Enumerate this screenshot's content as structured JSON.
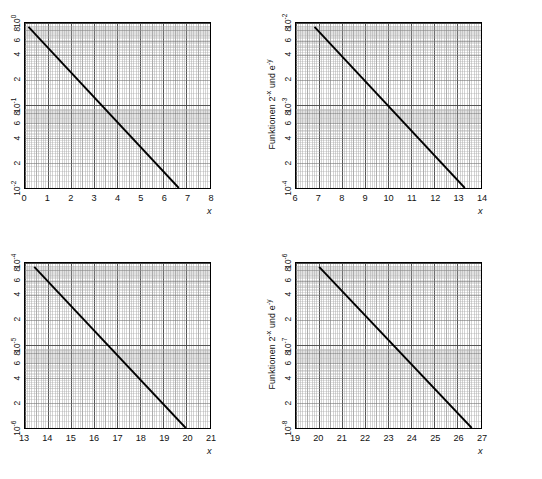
{
  "figure": {
    "kind": "semi-log-chart-grid",
    "background": "#ffffff",
    "line_color": "#000000",
    "grid_color": "#555555",
    "grid_minor_color": "#999999",
    "axis_title_y": "Funktionen 2",
    "axis_title_y_sup1": "-x",
    "axis_title_y_mid": " und e",
    "axis_title_y_sup2": "-y",
    "axis_title_x": "x"
  },
  "chart_data": [
    {
      "id": "panel-top-left",
      "type": "line",
      "title": "",
      "xlabel": "x",
      "ylabel": "Funktionen 2^-x und e^-y",
      "xlim": [
        0,
        8
      ],
      "ylim": [
        0.01,
        1
      ],
      "yscale": "log",
      "xscale": "linear",
      "grid": true,
      "legend": "none",
      "xticks": [
        "0",
        "1",
        "2",
        "3",
        "4",
        "5",
        "6",
        "7",
        "8"
      ],
      "xtick_values": [
        0,
        1,
        2,
        3,
        4,
        5,
        6,
        7,
        8
      ],
      "yticks": [
        "10",
        "8",
        "6",
        "4",
        "2",
        "10",
        "8",
        "6",
        "4",
        "2",
        "10"
      ],
      "ytick_exponents": [
        "0",
        "",
        "",
        "",
        "",
        "-1",
        "",
        "",
        "",
        "",
        "-2"
      ],
      "ytick_values": [
        1,
        0.8,
        0.6,
        0.4,
        0.2,
        0.1,
        0.08,
        0.06,
        0.04,
        0.02,
        0.01
      ],
      "series": [
        {
          "name": "2^-x",
          "x": [
            0.15,
            6.65
          ],
          "values": [
            0.9,
            0.01
          ]
        }
      ]
    },
    {
      "id": "panel-top-right",
      "type": "line",
      "title": "",
      "xlabel": "x",
      "ylabel": "Funktionen 2^-x und e^-y",
      "xlim": [
        6,
        14
      ],
      "ylim": [
        0.0001,
        0.01
      ],
      "yscale": "log",
      "xscale": "linear",
      "grid": true,
      "legend": "none",
      "xticks": [
        "6",
        "7",
        "8",
        "9",
        "10",
        "11",
        "12",
        "13",
        "14"
      ],
      "xtick_values": [
        6,
        7,
        8,
        9,
        10,
        11,
        12,
        13,
        14
      ],
      "yticks": [
        "10",
        "8",
        "6",
        "4",
        "2",
        "10",
        "8",
        "6",
        "4",
        "2",
        "10"
      ],
      "ytick_exponents": [
        "-2",
        "",
        "",
        "",
        "",
        "-3",
        "",
        "",
        "",
        "",
        "-4"
      ],
      "ytick_values": [
        0.01,
        0.008,
        0.006,
        0.004,
        0.002,
        0.001,
        0.0008,
        0.0006,
        0.0004,
        0.0002,
        0.0001
      ],
      "series": [
        {
          "name": "2^-x",
          "x": [
            6.8,
            13.3
          ],
          "values": [
            0.009,
            0.0001
          ]
        }
      ]
    },
    {
      "id": "panel-bottom-left",
      "type": "line",
      "title": "",
      "xlabel": "x",
      "ylabel": "Funktionen 2^-x und e^-y",
      "xlim": [
        13,
        21
      ],
      "ylim": [
        1e-06,
        0.0001
      ],
      "yscale": "log",
      "xscale": "linear",
      "grid": true,
      "legend": "none",
      "xticks": [
        "13",
        "14",
        "15",
        "16",
        "17",
        "18",
        "19",
        "20",
        "21"
      ],
      "xtick_values": [
        13,
        14,
        15,
        16,
        17,
        18,
        19,
        20,
        21
      ],
      "yticks": [
        "10",
        "8",
        "6",
        "4",
        "2",
        "10",
        "8",
        "6",
        "4",
        "2",
        "10"
      ],
      "ytick_exponents": [
        "-4",
        "",
        "",
        "",
        "",
        "-5",
        "",
        "",
        "",
        "",
        "-6"
      ],
      "ytick_values": [
        0.0001,
        8e-05,
        6e-05,
        4e-05,
        2e-05,
        1e-05,
        8e-06,
        6e-06,
        4e-06,
        2e-06,
        1e-06
      ],
      "series": [
        {
          "name": "2^-x",
          "x": [
            13.4,
            19.95
          ],
          "values": [
            9e-05,
            1e-06
          ]
        }
      ]
    },
    {
      "id": "panel-bottom-right",
      "type": "line",
      "title": "",
      "xlabel": "x",
      "ylabel": "Funktionen 2^-x und e^-y",
      "xlim": [
        19,
        27
      ],
      "ylim": [
        1e-08,
        1e-06
      ],
      "yscale": "log",
      "xscale": "linear",
      "grid": true,
      "legend": "none",
      "xticks": [
        "19",
        "20",
        "21",
        "22",
        "23",
        "24",
        "25",
        "26",
        "27"
      ],
      "xtick_values": [
        19,
        20,
        21,
        22,
        23,
        24,
        25,
        26,
        27
      ],
      "yticks": [
        "10",
        "8",
        "6",
        "4",
        "2",
        "10",
        "8",
        "6",
        "4",
        "2",
        "10"
      ],
      "ytick_exponents": [
        "-6",
        "",
        "",
        "",
        "",
        "-7",
        "",
        "",
        "",
        "",
        "-8"
      ],
      "ytick_values": [
        1e-06,
        8e-07,
        6e-07,
        4e-07,
        2e-07,
        1e-07,
        8e-08,
        6e-08,
        4e-08,
        2e-08,
        1e-08
      ],
      "series": [
        {
          "name": "2^-x",
          "x": [
            20.0,
            26.6
          ],
          "values": [
            9e-07,
            1e-08
          ]
        }
      ]
    }
  ]
}
